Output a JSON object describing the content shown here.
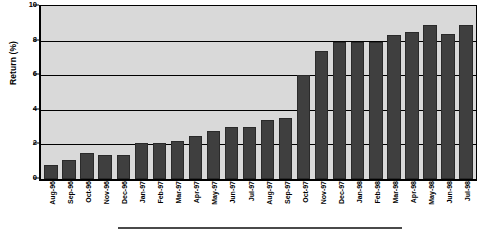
{
  "chart_data": {
    "type": "bar",
    "title": "",
    "xlabel": "",
    "ylabel": "Return (%)",
    "ylim": [
      0,
      10
    ],
    "yticks": [
      0,
      2,
      4,
      6,
      8,
      10
    ],
    "ytick_labels": [
      "0",
      "2",
      "4",
      "6",
      "8",
      "10"
    ],
    "grid": true,
    "legend": "none",
    "bar_color": "#3f3f3f",
    "plot_background": "#d9d9d9",
    "categories": [
      "Aug-96",
      "Sep-96",
      "Oct-96",
      "Nov-96",
      "Dec-96",
      "Jan-97",
      "Feb-97",
      "Mar-97",
      "Apr-97",
      "May-97",
      "Jun-97",
      "Jul-97",
      "Aug-97",
      "Sep-97",
      "Oct-97",
      "Nov-97",
      "Dec-97",
      "Jan-98",
      "Feb-98",
      "Mar-98",
      "Apr-98",
      "May-98",
      "Jun-98",
      "Jul-98"
    ],
    "values": [
      0.8,
      1.1,
      1.5,
      1.4,
      1.4,
      2.1,
      2.1,
      2.2,
      2.5,
      2.8,
      3.0,
      3.0,
      3.4,
      3.5,
      6.0,
      7.4,
      7.9,
      7.9,
      7.9,
      8.3,
      8.5,
      8.9,
      8.4,
      8.9
    ]
  }
}
